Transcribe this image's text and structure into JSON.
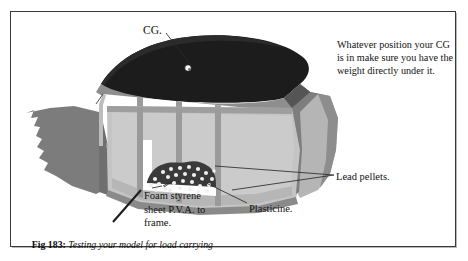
{
  "figure": {
    "caption_tag": "Fig 183:",
    "caption_text": "Testing your model for load carrying",
    "note": "Whatever position your CG is in make sure you have the weight directly under it.",
    "labels": {
      "cg": "CG.",
      "lead_pellets": "Lead pellets.",
      "plasticine": "Plasticine.",
      "foam_styrene": "Foam styrene sheet P.V.A. to frame."
    },
    "colors": {
      "deck_dark": "#1c1c1c",
      "hull_mid_gray": "#8e8e8e",
      "hull_light_gray": "#c0c0c0",
      "hull_pale_gray": "#cfcfcf",
      "transom_gray": "#b5b5b5",
      "bow_dark_gray": "#7c7c7c",
      "frame_gray": "#9a9a9a",
      "pellet_pile": "#3a3a3a",
      "pellet_dot": "#f2f2f2",
      "leader_line": "#2a2a2a",
      "border": "#3a3a3a",
      "paper": "#ffffff"
    }
  }
}
